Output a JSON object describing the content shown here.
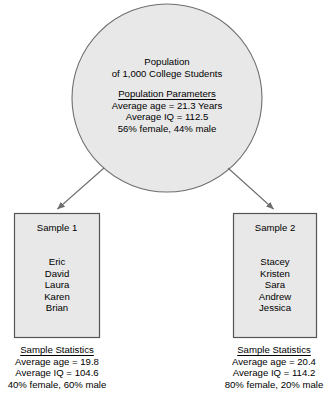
{
  "diagram": {
    "type": "sampling-diagram",
    "colors": {
      "shape_fill": "#e8e8e8",
      "shape_stroke": "#707070",
      "text": "#000000",
      "background": "#ffffff"
    },
    "population": {
      "shape": "circle",
      "line1": "Population",
      "line2": "of 1,000 College Students",
      "parameters_heading": "Population Parameters",
      "parameters": [
        "Average age = 21.3 Years",
        "Average IQ = 112.5",
        "56% female, 44% male"
      ]
    },
    "arrows": [
      {
        "name": "arrow-to-sample-1",
        "from": "population-circle",
        "to": "sample-1-box"
      },
      {
        "name": "arrow-to-sample-2",
        "from": "population-circle",
        "to": "sample-2-box"
      }
    ],
    "samples": [
      {
        "title": "Sample 1",
        "names": [
          "Eric",
          "David",
          "Laura",
          "Karen",
          "Brian"
        ],
        "stats_heading": "Sample Statistics",
        "stats": [
          "Average age = 19.8",
          "Average IQ = 104.6",
          "40% female, 60% male"
        ]
      },
      {
        "title": "Sample 2",
        "names": [
          "Stacey",
          "Kristen",
          "Sara",
          "Andrew",
          "Jessica"
        ],
        "stats_heading": "Sample Statistics",
        "stats": [
          "Average age = 20.4",
          "Average IQ = 114.2",
          "80% female, 20% male"
        ]
      }
    ]
  }
}
